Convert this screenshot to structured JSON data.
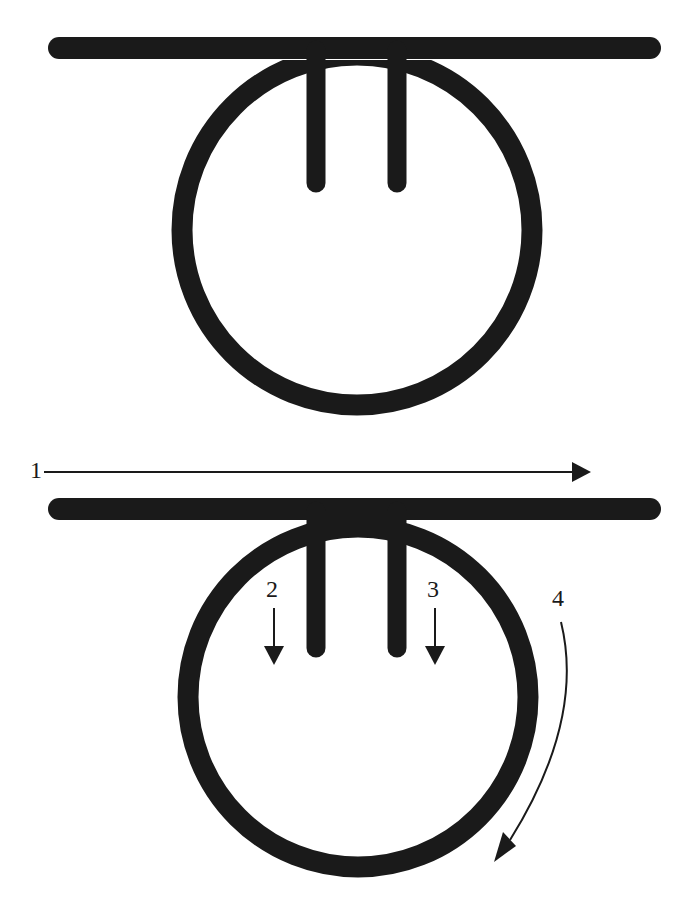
{
  "diagram": {
    "ink_color": "#1a1a1a",
    "background": "#ffffff",
    "top_figure": {
      "description": "Loop of cord hanging below a horizontal bar, with two vertical strands descending from the bar inside the loop"
    },
    "bottom_figure": {
      "description": "Same loop figure with numbered arrows indicating motion steps",
      "steps": [
        {
          "label": "1",
          "direction": "right",
          "note": "horizontal arrow above the bar"
        },
        {
          "label": "2",
          "direction": "down",
          "note": "arrow left of the left strand"
        },
        {
          "label": "3",
          "direction": "down",
          "note": "arrow right of the right strand"
        },
        {
          "label": "4",
          "direction": "clockwise-down",
          "note": "curved arrow along right side of loop"
        }
      ]
    }
  }
}
